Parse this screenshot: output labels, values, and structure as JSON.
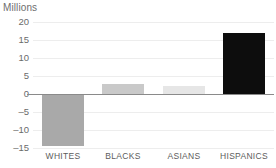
{
  "chart_data": {
    "type": "bar",
    "title": "Millions",
    "xlabel": "",
    "ylabel": "",
    "categories": [
      "WHITES",
      "BLACKS",
      "ASIANS",
      "HISPANICS"
    ],
    "values": [
      -14.5,
      2.7,
      2.2,
      17.0
    ],
    "bar_colors": [
      "#a9a9a9",
      "#c9c9c9",
      "#e6e6e6",
      "#0d0d0d"
    ],
    "ylim": [
      -15,
      20
    ],
    "yticks": [
      20,
      15,
      10,
      5,
      0,
      -5,
      -10,
      -15
    ],
    "ytick_labels": [
      "20",
      "15",
      "10",
      "5",
      "0",
      "–5",
      "–10",
      "–15"
    ],
    "grid": true,
    "legend": null,
    "zero_line": 0,
    "axis_color": "#8a8a8a",
    "grid_color": "#ededed",
    "text_color": "#6b6b6b"
  }
}
